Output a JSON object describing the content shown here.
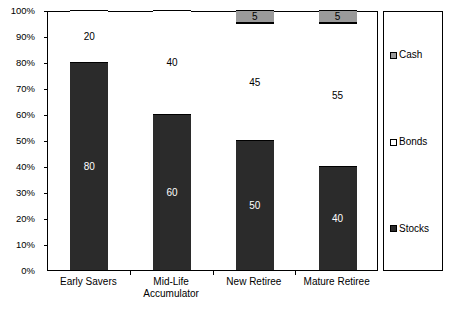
{
  "chart_data": {
    "type": "bar",
    "stacked": true,
    "title": "",
    "subtitle": "",
    "xlabel": "",
    "ylabel": "",
    "ylim": [
      0,
      100
    ],
    "grid": false,
    "legend_position": "right",
    "categories": [
      "Early Savers",
      "Mid-Life Accumulator",
      "New Retiree",
      "Mature Retiree"
    ],
    "category_label_lines": [
      [
        "Early Savers"
      ],
      [
        "Mid-Life",
        "Accumulator"
      ],
      [
        "New Retiree"
      ],
      [
        "Mature Retiree"
      ]
    ],
    "ytick_labels": [
      "0%",
      "10%",
      "20%",
      "30%",
      "40%",
      "50%",
      "60%",
      "70%",
      "80%",
      "90%",
      "100%"
    ],
    "ytick_values": [
      0,
      10,
      20,
      30,
      40,
      50,
      60,
      70,
      80,
      90,
      100
    ],
    "series": [
      {
        "name": "Stocks",
        "color": "#2b2b2b",
        "label_color": "#ffffff",
        "values": [
          80,
          60,
          50,
          40
        ],
        "data_labels": [
          "80",
          "60",
          "50",
          "40"
        ]
      },
      {
        "name": "Bonds",
        "color": "#ffffff",
        "label_color": "#000000",
        "values": [
          20,
          40,
          45,
          55
        ],
        "data_labels": [
          "20",
          "40",
          "45",
          "55"
        ]
      },
      {
        "name": "Cash",
        "color": "#9a9a9a",
        "label_color": "#000000",
        "values": [
          0,
          0,
          5,
          5
        ],
        "data_labels": [
          "",
          "",
          "5",
          "5"
        ]
      }
    ]
  },
  "legend": {
    "entries": [
      {
        "label": "Cash",
        "swatch": "cash-swatch",
        "color": "#9a9a9a"
      },
      {
        "label": "Bonds",
        "swatch": "bonds-swatch",
        "color": "#ffffff"
      },
      {
        "label": "Stocks",
        "swatch": "stocks-swatch",
        "color": "#2b2b2b"
      }
    ]
  },
  "axis_colors": {
    "axis_line": "#000000",
    "plot_background": "#ffffff"
  }
}
